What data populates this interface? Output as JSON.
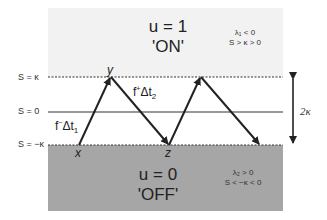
{
  "colors": {
    "on_region": "#f2f2f2",
    "off_region": "#a6a6a6",
    "line": "#222222"
  },
  "regions": {
    "on": {
      "state": "u = 1",
      "label": "'ON'",
      "condition_1": "λ₁ < 0",
      "condition_2": "S > κ > 0"
    },
    "off": {
      "state": "u = 0",
      "label": "'OFF'",
      "condition_1": "λ₂ > 0",
      "condition_2": "S < −κ < 0"
    }
  },
  "levels": {
    "upper": "S = κ",
    "zero": "S = 0",
    "lower": "S = −κ"
  },
  "points": {
    "x": "x",
    "y": "y",
    "z": "z"
  },
  "segments": {
    "rise": {
      "f": "f",
      "sign": "−",
      "dt": "Δt",
      "idx": "1"
    },
    "fall": {
      "f": "f",
      "sign": "+",
      "dt": "Δt",
      "idx": "2"
    }
  },
  "band_width": "2κ"
}
